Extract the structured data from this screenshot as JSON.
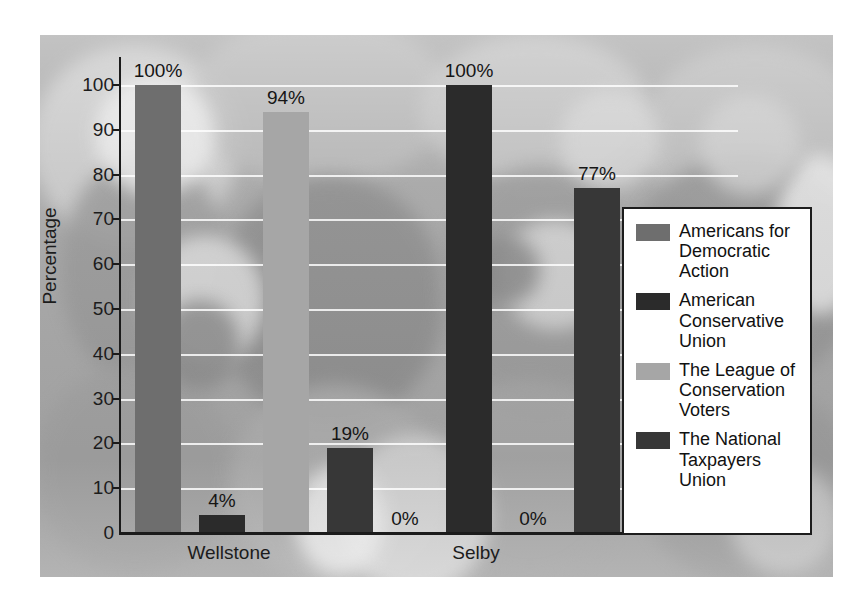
{
  "chart_data": {
    "type": "bar",
    "title": "",
    "subtitle": "",
    "xlabel": "",
    "ylabel": "Percentage",
    "ylim": [
      0,
      100
    ],
    "yticks": [
      0,
      10,
      20,
      30,
      40,
      50,
      60,
      70,
      80,
      90,
      100
    ],
    "ytick_labels": [
      "0",
      "10",
      "20",
      "30",
      "40",
      "50",
      "60",
      "70",
      "80",
      "90",
      "100"
    ],
    "grid": true,
    "legend_position": "right",
    "categories": [
      "Wellstone",
      "Selby"
    ],
    "series": [
      {
        "name": "Americans for Democratic Action",
        "color": "#6e6e6e",
        "values": [
          100,
          0
        ],
        "labels": [
          "100%",
          "0%"
        ]
      },
      {
        "name": "American Conservative Union",
        "color": "#2b2b2b",
        "values": [
          4,
          100
        ],
        "labels": [
          "4%",
          "100%"
        ]
      },
      {
        "name": "The League of Conservation Voters",
        "color": "#a6a6a6",
        "values": [
          94,
          0
        ],
        "labels": [
          "94%",
          "0%"
        ]
      },
      {
        "name": "The National Taxpayers Union",
        "color": "#373737",
        "values": [
          19,
          77
        ],
        "labels": [
          "19%",
          "77%"
        ]
      }
    ]
  },
  "legend": {
    "entries": [
      {
        "label": "Americans for Democratic Action",
        "color": "#6e6e6e"
      },
      {
        "label": "American Conservative Union",
        "color": "#2b2b2b"
      },
      {
        "label": "The League of Conservation Voters",
        "color": "#a6a6a6"
      },
      {
        "label": "The National Taxpayers Union",
        "color": "#373737"
      }
    ]
  }
}
